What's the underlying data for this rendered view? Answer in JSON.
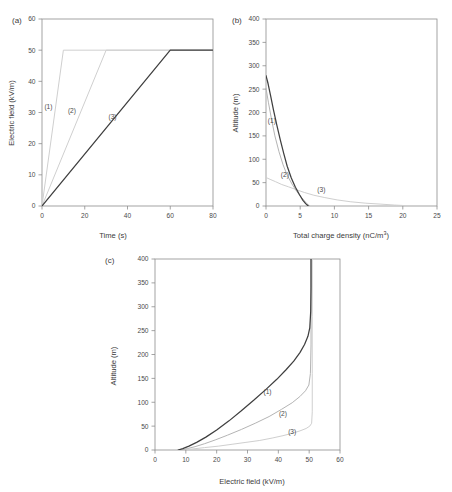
{
  "figure": {
    "panels": [
      {
        "id": "a",
        "label": "(a)",
        "xlabel": "Time (s)",
        "ylabel": "Electric field (kV/m)"
      },
      {
        "id": "b",
        "label": "(b)",
        "xlabel": "Total charge density (nC/m",
        "xlabel_sup": "3",
        "xlabel_tail": ")",
        "ylabel": "Altitude (m)"
      },
      {
        "id": "c",
        "label": "(c)",
        "xlabel": "Electric field (kV/m)",
        "ylabel": "Altitude (m)"
      }
    ],
    "series_labels": [
      "(1)",
      "(2)",
      "(3)"
    ],
    "colors": {
      "curve1_dark": "#3f3f3f",
      "curve2_mid": "#b4b4b4",
      "curve3_light": "#cfcfcf",
      "axis": "#8d8d8d",
      "text": "#3b3b3b",
      "background": "#ffffff"
    }
  },
  "chart_data": [
    {
      "type": "line",
      "panel": "a",
      "title": "",
      "xlabel": "Time (s)",
      "ylabel": "Electric field (kV/m)",
      "xlim": [
        0,
        80
      ],
      "ylim": [
        0,
        60
      ],
      "xticks": [
        0,
        20,
        40,
        60,
        80
      ],
      "yticks": [
        0,
        10,
        20,
        30,
        40,
        50,
        60
      ],
      "grid": false,
      "legend": "inline-curve-labels",
      "series": [
        {
          "name": "(1)",
          "color": "#cfcfcf",
          "label_xy": [
            3.0,
            31.0
          ],
          "x": [
            0,
            10,
            80
          ],
          "y": [
            0,
            50,
            50
          ]
        },
        {
          "name": "(2)",
          "color": "#cfcfcf",
          "label_xy": [
            14.0,
            30.0
          ],
          "x": [
            0,
            30,
            80
          ],
          "y": [
            0,
            50,
            50
          ]
        },
        {
          "name": "(3)",
          "color": "#3f3f3f",
          "label_xy": [
            33.0,
            28.0
          ],
          "x": [
            0,
            60,
            80
          ],
          "y": [
            0,
            50,
            50
          ]
        }
      ]
    },
    {
      "type": "line",
      "panel": "b",
      "title": "",
      "xlabel": "Total charge density (nC/m3)",
      "ylabel": "Altitude (m)",
      "xlim": [
        0,
        25
      ],
      "ylim": [
        0,
        400
      ],
      "xticks": [
        0,
        5,
        10,
        15,
        20,
        25
      ],
      "yticks": [
        0,
        50,
        100,
        150,
        200,
        250,
        300,
        350,
        400
      ],
      "grid": false,
      "legend": "inline-curve-labels",
      "series": [
        {
          "name": "(1)",
          "color": "#3f3f3f",
          "label_xy": [
            0.85,
            178.0
          ],
          "x": [
            0.0,
            0.3,
            0.7,
            1.1,
            1.6,
            2.1,
            2.6,
            3.1,
            3.7,
            4.3,
            4.9,
            5.4,
            5.8,
            6.1,
            6.2
          ],
          "y": [
            279,
            262,
            234,
            205,
            172,
            141,
            112,
            85,
            60,
            40,
            24,
            12,
            5,
            1,
            0
          ]
        },
        {
          "name": "(2)",
          "color": "#b4b4b4",
          "label_xy": [
            2.75,
            62.0
          ],
          "x": [
            0.0,
            0.35,
            0.8,
            1.3,
            1.9,
            2.5,
            3.1,
            3.8,
            4.5,
            5.2,
            5.8,
            6.2,
            6.4
          ],
          "y": [
            252,
            222,
            186,
            150,
            116,
            88,
            66,
            47,
            31,
            18,
            8,
            2,
            0
          ]
        },
        {
          "name": "(3)",
          "color": "#cfcfcf",
          "label_xy": [
            8.1,
            30.0
          ],
          "x": [
            0.0,
            0.6,
            1.4,
            2.3,
            3.3,
            4.4,
            5.6,
            7.0,
            8.6,
            10.4,
            12.4,
            14.6,
            16.8,
            18.8,
            20.2
          ],
          "y": [
            61,
            57,
            52,
            46,
            41,
            35,
            29,
            23,
            18,
            13,
            9,
            6,
            4,
            2,
            1
          ]
        }
      ]
    },
    {
      "type": "line",
      "panel": "c",
      "title": "",
      "xlabel": "Electric field (kV/m)",
      "ylabel": "Altitude (m)",
      "xlim": [
        0,
        60
      ],
      "ylim": [
        0,
        400
      ],
      "xticks": [
        0,
        10,
        20,
        30,
        40,
        50,
        60
      ],
      "yticks": [
        0,
        50,
        100,
        150,
        200,
        250,
        300,
        350,
        400
      ],
      "grid": false,
      "legend": "inline-curve-labels",
      "series": [
        {
          "name": "(1)",
          "color": "#3f3f3f",
          "label_xy": [
            36.5,
            117.0
          ],
          "x": [
            7.5,
            9.0,
            11.0,
            13.5,
            16.5,
            20.0,
            24.0,
            28.0,
            32.0,
            36.0,
            39.5,
            42.5,
            45.0,
            47.0,
            48.5,
            49.6,
            50.2,
            50.5,
            50.6,
            50.6
          ],
          "y": [
            0,
            3,
            8,
            16,
            27,
            42,
            61,
            82,
            104,
            127,
            148,
            168,
            186,
            204,
            221,
            238,
            256,
            290,
            340,
            400
          ]
        },
        {
          "name": "(2)",
          "color": "#b4b4b4",
          "label_xy": [
            41.5,
            72.0
          ],
          "x": [
            8.5,
            10.5,
            13.0,
            16.0,
            19.5,
            23.5,
            28.0,
            32.5,
            37.0,
            41.0,
            44.5,
            47.0,
            48.8,
            49.9,
            50.4,
            50.6,
            50.6,
            50.6
          ],
          "y": [
            0,
            3,
            7,
            13,
            21,
            31,
            43,
            56,
            70,
            85,
            99,
            112,
            124,
            136,
            160,
            220,
            310,
            400
          ]
        },
        {
          "name": "(3)",
          "color": "#cfcfcf",
          "label_xy": [
            44.5,
            33.0
          ],
          "x": [
            9.0,
            12.0,
            16.0,
            20.5,
            25.0,
            29.5,
            34.0,
            38.0,
            41.5,
            44.5,
            47.0,
            49.0,
            50.2,
            50.8,
            51.0,
            51.0,
            51.0,
            51.0
          ],
          "y": [
            0,
            2,
            5,
            8,
            12,
            16,
            20,
            25,
            30,
            35,
            40,
            45,
            50,
            56,
            80,
            160,
            280,
            400
          ]
        }
      ]
    }
  ]
}
